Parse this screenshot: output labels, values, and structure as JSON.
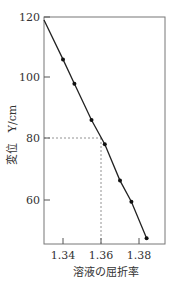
{
  "chart_data": {
    "type": "line",
    "title": "",
    "xlabel": "溶液の屈折率",
    "ylabel": "変位　Y/cm",
    "xlim": [
      1.33,
      1.39
    ],
    "ylim": [
      45,
      120
    ],
    "x_ticks": [
      "1.34",
      "1.36",
      "1.38"
    ],
    "y_ticks": [
      "60",
      "80",
      "100",
      "120"
    ],
    "grid": false,
    "series": [
      {
        "name": "calibration",
        "x": [
          1.34,
          1.346,
          1.355,
          1.362,
          1.37,
          1.376,
          1.384
        ],
        "y": [
          106,
          98,
          86,
          78,
          66,
          59,
          47
        ],
        "marker": "dot",
        "line_extends_to": {
          "x": 1.33,
          "y": 119
        }
      }
    ],
    "annotations": [
      {
        "type": "dashed-guide",
        "x": 1.361,
        "y": 80,
        "description": "dashed lines from Y=80 to the line and down to x≈1.361"
      }
    ]
  }
}
